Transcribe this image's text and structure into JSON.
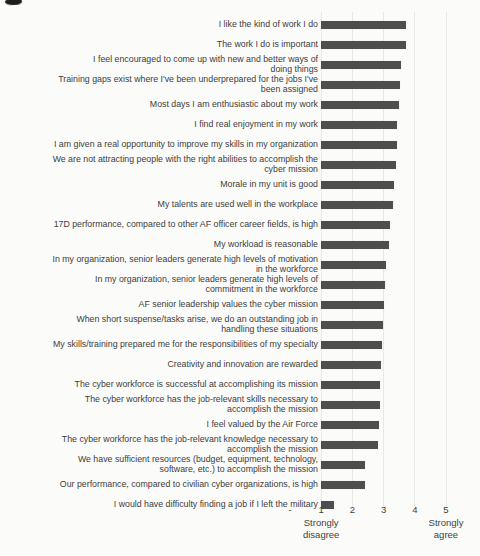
{
  "page": {
    "background_color": "#fbfbf9",
    "has_scan_artifact_top_left": true
  },
  "chart_data": {
    "type": "bar",
    "orientation": "horizontal",
    "title": "",
    "xlabel": "",
    "ylabel": "",
    "xlim": [
      0,
      5
    ],
    "bar_base": 1,
    "grid": true,
    "bar_color": "#4e4e4e",
    "gridline_color": "#e8e8e4",
    "text_color": "#3d3d3d",
    "x_ticks": [
      {
        "value": 0,
        "label": "-"
      },
      {
        "value": 1,
        "label": "1"
      },
      {
        "value": 2,
        "label": "2"
      },
      {
        "value": 3,
        "label": "3"
      },
      {
        "value": 4,
        "label": "4"
      },
      {
        "value": 5,
        "label": "5"
      }
    ],
    "axis_captions": [
      {
        "value": 1,
        "label": "Strongly\ndisagree"
      },
      {
        "value": 5,
        "label": "Strongly\nagree"
      }
    ],
    "categories": [
      "I like the kind of work I do",
      "The work I do is important",
      "I feel encouraged to come up with new and better ways of\ndoing things",
      "Training gaps exist where I've been underprepared for the jobs I've\nbeen assigned",
      "Most days I am enthusiastic about my work",
      "I find real enjoyment in my work",
      "I am given a real opportunity to improve my skills in my organization",
      "We are not attracting people with the right abilities to accomplish the\ncyber mission",
      "Morale in my unit is good",
      "My talents are used well in the workplace",
      "17D performance, compared to other AF officer career fields, is high",
      "My workload is reasonable",
      "In my organization, senior leaders generate high levels of motivation\nin the workforce",
      "In my organization, senior leaders generate high levels of\ncommitment in the workforce",
      "AF senior leadership values the cyber mission",
      "When short suspense/tasks arise, we do an outstanding job in\nhandling these situations",
      "My skills/training prepared me for the responsibilities of my specialty",
      "Creativity and innovation are rewarded",
      "The cyber workforce is successful at accomplishing its mission",
      "The cyber workforce has the job-relevant skills necessary to\naccomplish the mission",
      "I feel valued by the Air Force",
      "The cyber workforce has the job-relevant knowledge necessary to\naccomplish the mission",
      "We have sufficient resources (budget, equipment, technology,\nsoftware, etc.) to accomplish the mission",
      "Our performance, compared to civilian cyber organizations, is high",
      "I would have difficulty finding a job if I left the military"
    ],
    "values": [
      3.72,
      3.71,
      3.55,
      3.53,
      3.49,
      3.44,
      3.42,
      3.4,
      3.34,
      3.31,
      3.21,
      3.17,
      3.08,
      3.04,
      3.01,
      2.99,
      2.94,
      2.91,
      2.9,
      2.89,
      2.86,
      2.83,
      2.4,
      2.42,
      1.41
    ]
  }
}
